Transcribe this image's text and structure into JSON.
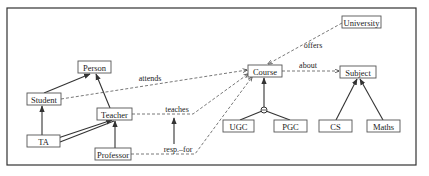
{
  "diagram": {
    "type": "conceptual-ontology",
    "nodes": {
      "person": "Person",
      "student": "Student",
      "teacher": "Teacher",
      "ta": "TA",
      "professor": "Professor",
      "course": "Course",
      "university": "University",
      "subject": "Subject",
      "ugc": "UGC",
      "pgc": "PGC",
      "cs": "CS",
      "maths": "Maths"
    },
    "edge_labels": {
      "attends": "attends",
      "teaches": "teaches",
      "resp_for": "resp.–for",
      "offers": "offers",
      "about": "about"
    },
    "relations": [
      {
        "from": "Student",
        "to": "Person",
        "kind": "is-a"
      },
      {
        "from": "Teacher",
        "to": "Person",
        "kind": "is-a"
      },
      {
        "from": "TA",
        "to": "Student",
        "kind": "is-a"
      },
      {
        "from": "TA",
        "to": "Teacher",
        "kind": "is-a"
      },
      {
        "from": "Professor",
        "to": "Teacher",
        "kind": "is-a"
      },
      {
        "from": "UGC",
        "to": "Course",
        "kind": "is-a (disjoint)"
      },
      {
        "from": "PGC",
        "to": "Course",
        "kind": "is-a (disjoint)"
      },
      {
        "from": "CS",
        "to": "Subject",
        "kind": "is-a"
      },
      {
        "from": "Maths",
        "to": "Subject",
        "kind": "is-a"
      },
      {
        "from": "Student",
        "to": "Course",
        "kind": "attends"
      },
      {
        "from": "Teacher",
        "to": "Course",
        "kind": "teaches"
      },
      {
        "from": "Professor",
        "to": "Course",
        "kind": "resp.–for"
      },
      {
        "from": "University",
        "to": "Course",
        "kind": "offers"
      },
      {
        "from": "Course",
        "to": "Subject",
        "kind": "about"
      }
    ],
    "colors": {
      "line": "#333333",
      "box_border": "#555555",
      "background": "#ffffff"
    }
  }
}
